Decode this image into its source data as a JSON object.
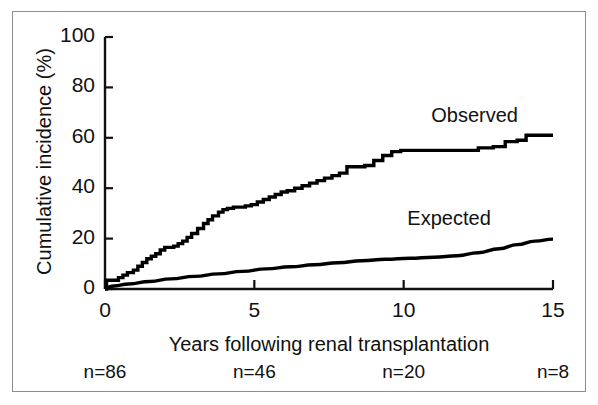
{
  "chart_data": {
    "type": "line",
    "title": "",
    "xlabel": "Years following renal transplantation",
    "ylabel": "Cumulative incidence (%)",
    "xlim": [
      0,
      15
    ],
    "ylim": [
      0,
      100
    ],
    "xticks": [
      "0",
      "5",
      "10",
      "15"
    ],
    "xtick_values": [
      0,
      5,
      10,
      15
    ],
    "yticks": [
      "0",
      "20",
      "40",
      "60",
      "80",
      "100"
    ],
    "ytick_values": [
      0,
      20,
      40,
      60,
      80,
      100
    ],
    "grid": false,
    "legend_position": "inline-annotation",
    "line_color": "#000000",
    "background_color": "#ffffff",
    "series": [
      {
        "name": "Observed",
        "style": "step",
        "label_annotation": "Observed",
        "x": [
          0,
          0.05,
          0.25,
          0.45,
          0.6,
          0.75,
          0.95,
          1.1,
          1.25,
          1.4,
          1.55,
          1.7,
          1.85,
          2.0,
          2.15,
          2.3,
          2.45,
          2.6,
          2.75,
          2.9,
          3.1,
          3.3,
          3.45,
          3.6,
          3.8,
          3.95,
          4.1,
          4.3,
          4.5,
          4.7,
          4.9,
          5.1,
          5.3,
          5.5,
          5.7,
          5.9,
          6.1,
          6.35,
          6.6,
          6.85,
          7.1,
          7.35,
          7.6,
          7.85,
          8.1,
          8.4,
          8.7,
          9.0,
          9.3,
          9.6,
          9.9,
          10.2,
          10.6,
          11.0,
          11.5,
          12.0,
          12.5,
          13.0,
          13.4,
          13.8,
          14.1,
          14.4,
          14.7,
          15.0
        ],
        "y": [
          0,
          3.5,
          3.5,
          4.5,
          5.5,
          6.5,
          7.5,
          9.0,
          10.5,
          12.0,
          13.0,
          14.0,
          15.5,
          16.5,
          16.5,
          17.0,
          18.0,
          19.0,
          20.5,
          22.0,
          24.0,
          26.0,
          27.5,
          29.0,
          30.5,
          31.5,
          32.0,
          32.5,
          32.5,
          33.0,
          33.5,
          34.5,
          35.5,
          36.5,
          37.5,
          38.5,
          39.0,
          40.0,
          41.0,
          42.0,
          43.0,
          44.0,
          45.0,
          46.0,
          48.5,
          48.5,
          49.0,
          51.0,
          53.0,
          54.5,
          55.0,
          55.0,
          55.0,
          55.0,
          55.0,
          55.0,
          56.0,
          56.5,
          58.5,
          59.0,
          61.0,
          61.0,
          61.0,
          61.0
        ]
      },
      {
        "name": "Expected",
        "style": "smooth",
        "label_annotation": "Expected",
        "x": [
          0,
          0.3,
          0.8,
          1.5,
          2.2,
          3.0,
          3.8,
          4.6,
          5.4,
          6.2,
          7.0,
          7.8,
          8.6,
          9.4,
          10.2,
          11.0,
          11.8,
          12.5,
          13.2,
          13.8,
          14.4,
          15.0
        ],
        "y": [
          0.5,
          1.2,
          2.0,
          3.0,
          4.0,
          5.0,
          6.0,
          7.0,
          8.0,
          8.8,
          9.6,
          10.4,
          11.2,
          11.8,
          12.2,
          12.6,
          13.2,
          14.4,
          16.0,
          17.6,
          19.0,
          19.8
        ]
      }
    ],
    "annotations": [
      {
        "name": "observed-label",
        "text": "Observed",
        "x": 13.0,
        "y": 68
      },
      {
        "name": "expected-label",
        "text": "Expected",
        "x": 12.2,
        "y": 27
      }
    ],
    "numbers_at_risk": {
      "label_prefix": "n=",
      "entries": [
        {
          "x": 0,
          "text": "n=86",
          "value": 86
        },
        {
          "x": 5,
          "text": "n=46",
          "value": 46
        },
        {
          "x": 10,
          "text": "n=20",
          "value": 20
        },
        {
          "x": 15,
          "text": "n=8",
          "value": 8
        }
      ]
    }
  }
}
